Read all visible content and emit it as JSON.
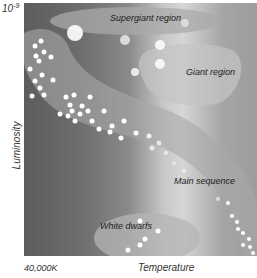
{
  "axes": {
    "y_max_base": "10",
    "y_max_exp": "-9",
    "y_label": "Luminosity",
    "x_min_label": "40,000K",
    "x_label": "Temperature"
  },
  "regions": [
    {
      "id": "supergiant",
      "label": "Supergiant region"
    },
    {
      "id": "giant",
      "label": "Giant region"
    },
    {
      "id": "main_sequence",
      "label": "Main sequence"
    },
    {
      "id": "white_dwarfs",
      "label": "White dwarfs"
    }
  ],
  "colors": {
    "background_dark": "#5c5c5c",
    "background_light": "#d6d6d6",
    "region_fill": "#b8b8b8",
    "star": "#ffffff",
    "text": "#222222"
  }
}
